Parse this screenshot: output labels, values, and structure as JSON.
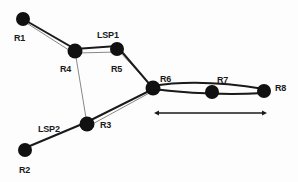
{
  "diagram": {
    "type": "network-topology",
    "nodes": [
      {
        "id": "R1",
        "label": "R1",
        "x": 23,
        "y": 19
      },
      {
        "id": "R4",
        "label": "R4",
        "x": 75,
        "y": 51
      },
      {
        "id": "R5",
        "label": "R5",
        "x": 117,
        "y": 49
      },
      {
        "id": "R6",
        "label": "R6",
        "x": 153,
        "y": 88
      },
      {
        "id": "R7",
        "label": "R7",
        "x": 212,
        "y": 92
      },
      {
        "id": "R8",
        "label": "R8",
        "x": 264,
        "y": 91
      },
      {
        "id": "R3",
        "label": "R3",
        "x": 87,
        "y": 124
      },
      {
        "id": "R2",
        "label": "R2",
        "x": 25,
        "y": 150
      }
    ],
    "links": [
      [
        "R1",
        "R4"
      ],
      [
        "R4",
        "R5"
      ],
      [
        "R5",
        "R6"
      ],
      [
        "R6",
        "R7"
      ],
      [
        "R7",
        "R8"
      ],
      [
        "R4",
        "R3"
      ],
      [
        "R2",
        "R3"
      ],
      [
        "R3",
        "R6"
      ]
    ],
    "paths": [
      {
        "name": "LSP1",
        "label": "LSP1",
        "route": [
          "R1",
          "R4",
          "R5",
          "R6",
          "R7",
          "R8"
        ]
      },
      {
        "name": "LSP2",
        "label": "LSP2",
        "route": [
          "R2",
          "R3",
          "R6",
          "R7",
          "R8"
        ]
      }
    ],
    "annotations": {
      "shared_segment_arrow": {
        "from": "R6",
        "to": "R8"
      }
    }
  }
}
